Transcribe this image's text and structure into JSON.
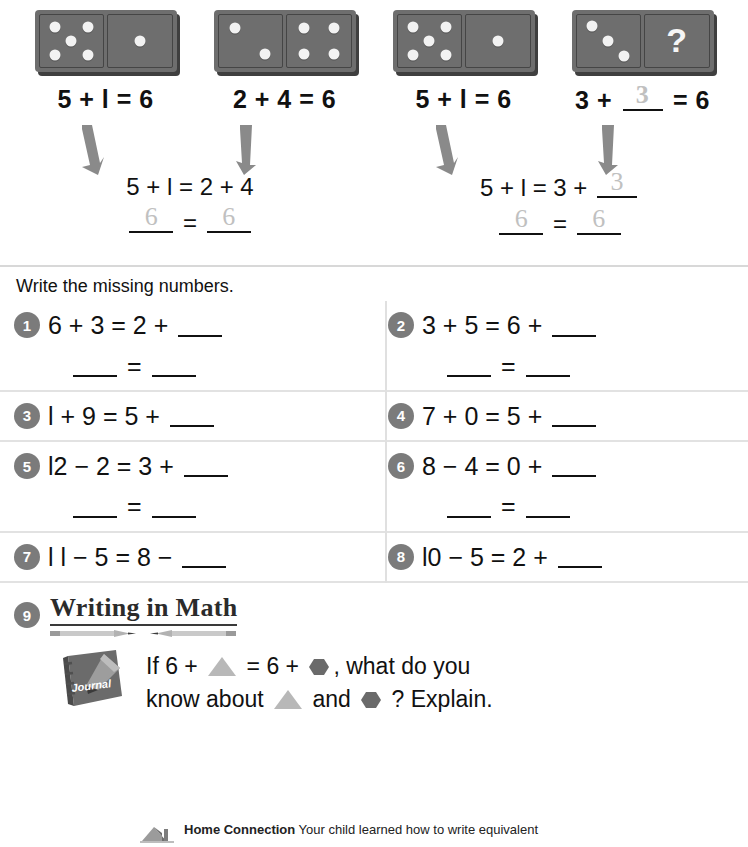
{
  "dominoes": [
    {
      "name": "domino-5-1",
      "left_pips": 5,
      "right_pips": 1,
      "right_question": false,
      "equation": "5 + l = 6"
    },
    {
      "name": "domino-2-4",
      "left_pips": 2,
      "right_pips": 4,
      "right_question": false,
      "equation": "2 + 4 = 6"
    },
    {
      "name": "domino-5-1b",
      "left_pips": 5,
      "right_pips": 1,
      "right_question": false,
      "equation": "5 + l = 6"
    },
    {
      "name": "domino-3-q",
      "left_pips": 3,
      "right_pips": 0,
      "right_question": true,
      "question_mark": "?",
      "equation_parts": {
        "prefix": "3 + ",
        "blank_answer": "3",
        "suffix": " = 6"
      }
    }
  ],
  "steps": [
    {
      "equation": "5 + l = 2 + 4",
      "result_left": "6",
      "equals": "=",
      "result_right": "6"
    },
    {
      "equation_prefix": "5 + l = 3 + ",
      "equation_blank_answer": "3",
      "result_left": "6",
      "equals": "=",
      "result_right": "6"
    }
  ],
  "directions": "Write the missing numbers.",
  "problems": [
    {
      "number": "1",
      "expression": "6 + 3 = 2 + ",
      "has_blank": true,
      "second_line": "____ = ____"
    },
    {
      "number": "2",
      "expression": "3 + 5 = 6 + ",
      "has_blank": true,
      "second_line": "____ = ____"
    },
    {
      "number": "3",
      "expression": "l + 9 = 5 + ",
      "has_blank": true,
      "second_line": ""
    },
    {
      "number": "4",
      "expression": "7 + 0 = 5 + ",
      "has_blank": true,
      "second_line": ""
    },
    {
      "number": "5",
      "expression": "l2 − 2 = 3 + ",
      "has_blank": true,
      "second_line": "____ = ____"
    },
    {
      "number": "6",
      "expression": "8 − 4 = 0 + ",
      "has_blank": true,
      "second_line": "____ = ____"
    },
    {
      "number": "7",
      "expression": "l l − 5 = 8 − ",
      "has_blank": true,
      "second_line": ""
    },
    {
      "number": "8",
      "expression": "l0 − 5 = 2 + ",
      "has_blank": true,
      "second_line": ""
    }
  ],
  "writing_in_math": {
    "number": "9",
    "title": "Writing in Math",
    "journal_label": "Journal",
    "prompt_line1_a": "If 6 + ",
    "prompt_line1_b": " = 6 + ",
    "prompt_line1_c": ", what do you",
    "prompt_line2_a": "know about ",
    "prompt_line2_b": " and ",
    "prompt_line2_c": " ? Explain."
  },
  "home_connection": {
    "label": "Home Connection",
    "text": " Your child learned how to write equivalent"
  },
  "colors": {
    "domino_face": "#6e6e6e",
    "domino_shadow": "#3f3f3f",
    "pip": "#f2f2f2",
    "badge": "#7b7b7b",
    "arrow": "#8a8a8a",
    "rule": "#d8d8d8",
    "triangle": "#b8b8b8",
    "hexagon": "#6a6a6a",
    "traced": "#bdbdbd"
  }
}
